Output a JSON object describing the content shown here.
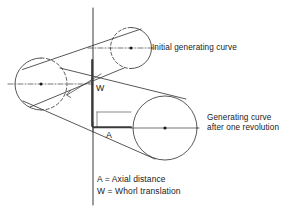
{
  "figure": {
    "background_color": "#ffffff",
    "line_color": "#3a3a3a",
    "text_color": "#1a1a1a"
  },
  "annotations": {
    "initial_curve_label": "Initial generating curve",
    "generating_curve_line1": "Generating curve",
    "generating_curve_line2": "after one revolution",
    "axial_distance_letter": "A",
    "whorl_translation_letter": "W"
  },
  "legend": {
    "axial_distance": "A = Axial distance",
    "whorl_translation": "W = Whorl translation"
  },
  "geometry": {
    "coiling_axis": {
      "x": 93,
      "y_top": 8,
      "y_bottom": 205
    },
    "whorl_translation_segment": {
      "x": 93,
      "y_top": 60,
      "y_bottom": 126
    },
    "axial_distance_segment": {
      "y": 127,
      "x_start": 93,
      "x_end": 131
    },
    "circles": [
      {
        "name": "initial-generating-curve",
        "cx": 131,
        "cy": 48,
        "r": 20.5,
        "style": "half-dashed-left"
      },
      {
        "name": "left-generating-curve",
        "cx": 41,
        "cy": 84,
        "r": 26,
        "style": "half-dashed-right"
      },
      {
        "name": "generating-curve-after-one-revolution",
        "cx": 165,
        "cy": 128,
        "r": 32,
        "style": "solid"
      }
    ]
  }
}
